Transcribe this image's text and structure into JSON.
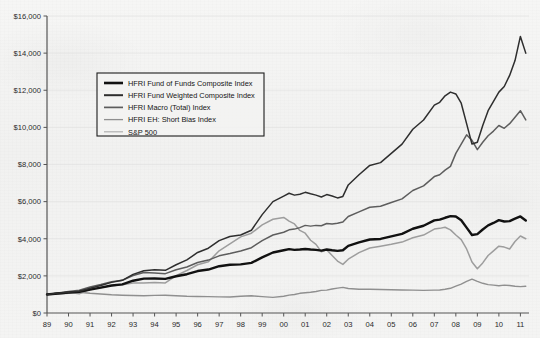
{
  "chart_data": {
    "type": "line",
    "title": "",
    "subtitle": "",
    "xlabel": "",
    "ylabel": "",
    "ylim": [
      0,
      16000
    ],
    "xlim": [
      1989,
      2011.4
    ],
    "grid": "faint-horizontal",
    "legend_position": "upper-left-inset",
    "ytick_labels": [
      "$0",
      "$2,000",
      "$4,000",
      "$6,000",
      "$8,000",
      "$10,000",
      "$12,000",
      "$14,000",
      "$16,000"
    ],
    "ytick_values": [
      0,
      2000,
      4000,
      6000,
      8000,
      10000,
      12000,
      14000,
      16000
    ],
    "xtick_labels": [
      "89",
      "90",
      "91",
      "92",
      "93",
      "94",
      "95",
      "96",
      "97",
      "98",
      "99",
      "00",
      "01",
      "02",
      "03",
      "04",
      "05",
      "06",
      "07",
      "08",
      "09",
      "10",
      "11"
    ],
    "x": [
      1989,
      1989.5,
      1990,
      1990.5,
      1991,
      1991.5,
      1992,
      1992.5,
      1993,
      1993.5,
      1994,
      1994.5,
      1995,
      1995.5,
      1996,
      1996.5,
      1997,
      1997.5,
      1998,
      1998.5,
      1999,
      1999.5,
      2000,
      2000.25,
      2000.5,
      2000.75,
      2001,
      2001.25,
      2001.5,
      2001.75,
      2002,
      2002.25,
      2002.5,
      2002.75,
      2003,
      2003.5,
      2004,
      2004.5,
      2005,
      2005.5,
      2006,
      2006.5,
      2007,
      2007.25,
      2007.5,
      2007.75,
      2008,
      2008.25,
      2008.5,
      2008.75,
      2009,
      2009.25,
      2009.5,
      2009.75,
      2010,
      2010.25,
      2010.5,
      2010.75,
      2011,
      2011.25
    ],
    "series": [
      {
        "name": "HFRI Fund Weighted Composite Index",
        "color": "#2e2e2e",
        "width": 1.5,
        "values": [
          1000,
          1060,
          1120,
          1170,
          1330,
          1480,
          1650,
          1760,
          2080,
          2280,
          2330,
          2300,
          2600,
          2860,
          3260,
          3490,
          3900,
          4120,
          4200,
          4460,
          5300,
          6000,
          6300,
          6450,
          6350,
          6400,
          6500,
          6420,
          6350,
          6250,
          6380,
          6300,
          6200,
          6280,
          6900,
          7450,
          7950,
          8100,
          8600,
          9100,
          9900,
          10400,
          11200,
          11350,
          11700,
          11900,
          11800,
          11300,
          10200,
          9100,
          9200,
          10100,
          10900,
          11400,
          11900,
          12200,
          12800,
          13600,
          14900,
          14000
        ]
      },
      {
        "name": "HFRI Macro (Total) Index",
        "color": "#5d5d5d",
        "width": 1.5,
        "values": [
          1000,
          1080,
          1160,
          1230,
          1400,
          1530,
          1680,
          1760,
          2020,
          2180,
          2150,
          2120,
          2330,
          2480,
          2720,
          2850,
          3080,
          3200,
          3340,
          3520,
          3900,
          4200,
          4350,
          4480,
          4520,
          4600,
          4720,
          4680,
          4720,
          4700,
          4820,
          4800,
          4830,
          4900,
          5200,
          5450,
          5700,
          5750,
          5950,
          6150,
          6600,
          6850,
          7350,
          7450,
          7700,
          7900,
          8600,
          9100,
          9600,
          9300,
          8800,
          9200,
          9550,
          9800,
          10100,
          9950,
          10200,
          10550,
          10900,
          10400
        ]
      },
      {
        "name": "HFRI Fund of Funds Composite Index",
        "color": "#111111",
        "width": 2.4,
        "values": [
          1000,
          1050,
          1100,
          1140,
          1260,
          1370,
          1480,
          1540,
          1740,
          1850,
          1860,
          1840,
          1980,
          2090,
          2260,
          2340,
          2520,
          2600,
          2620,
          2700,
          3000,
          3260,
          3380,
          3440,
          3400,
          3420,
          3450,
          3420,
          3400,
          3360,
          3420,
          3380,
          3350,
          3380,
          3620,
          3800,
          3960,
          3990,
          4130,
          4260,
          4540,
          4700,
          4990,
          5030,
          5130,
          5220,
          5200,
          5000,
          4600,
          4200,
          4250,
          4500,
          4720,
          4850,
          5000,
          4930,
          4950,
          5080,
          5200,
          4980
        ]
      },
      {
        "name": "S&P 500",
        "color": "#9d9d9d",
        "width": 1.5,
        "values": [
          1000,
          1070,
          1120,
          1040,
          1280,
          1380,
          1470,
          1520,
          1620,
          1610,
          1640,
          1620,
          2010,
          2290,
          2600,
          2760,
          3350,
          3720,
          4100,
          4300,
          4750,
          5050,
          5150,
          4950,
          4800,
          4450,
          4300,
          3920,
          3700,
          3300,
          3400,
          3100,
          2800,
          2620,
          2900,
          3250,
          3500,
          3600,
          3700,
          3820,
          4050,
          4200,
          4520,
          4560,
          4620,
          4480,
          4200,
          3950,
          3450,
          2750,
          2380,
          2700,
          3100,
          3350,
          3600,
          3550,
          3450,
          3850,
          4150,
          4000
        ]
      },
      {
        "name": "HFRI EH: Short Bias Index",
        "color": "#8f8f8f",
        "width": 1.4,
        "values": [
          1000,
          1020,
          1060,
          1120,
          1060,
          1020,
          980,
          960,
          940,
          930,
          950,
          960,
          930,
          900,
          890,
          880,
          870,
          860,
          900,
          930,
          880,
          840,
          900,
          960,
          1000,
          1060,
          1090,
          1120,
          1160,
          1220,
          1230,
          1290,
          1340,
          1380,
          1320,
          1280,
          1280,
          1270,
          1250,
          1240,
          1230,
          1220,
          1230,
          1240,
          1280,
          1330,
          1450,
          1560,
          1700,
          1820,
          1700,
          1600,
          1530,
          1500,
          1470,
          1500,
          1480,
          1440,
          1420,
          1440
        ]
      }
    ],
    "legend_entries": [
      {
        "label": "HFRI Fund of Funds Composite Index",
        "color": "#111111",
        "width": 2.6
      },
      {
        "label": "HFRI Fund Weighted Composite Index",
        "color": "#2e2e2e",
        "width": 2.0
      },
      {
        "label": "HFRI Macro (Total) Index",
        "color": "#5d5d5d",
        "width": 1.7
      },
      {
        "label": "HFRI EH: Short Bias Index",
        "color": "#8f8f8f",
        "width": 1.3
      },
      {
        "label": "S&P 500",
        "color": "#b0b0b0",
        "width": 1.2
      }
    ]
  }
}
